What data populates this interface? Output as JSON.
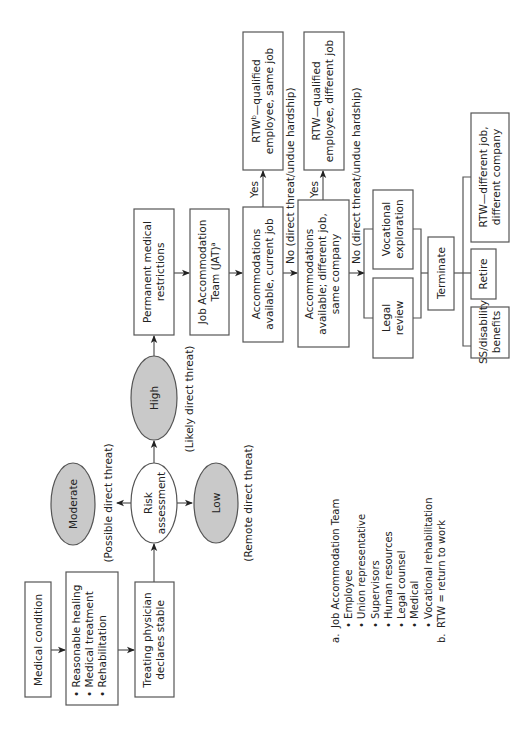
{
  "diagram": {
    "orientation": "rotated-90-ccw",
    "nodes": {
      "medical_condition": "Medical condition",
      "treatment": {
        "items": [
          "Reasonable healing",
          "Medical treatment",
          "Rehabilitation"
        ]
      },
      "treating_physician": [
        "Treating physician",
        "declares stable"
      ],
      "risk_assessment": [
        "Risk",
        "assessment"
      ],
      "moderate": "Moderate",
      "high": "High",
      "low": "Low",
      "permanent_restrictions": [
        "Permanent medical",
        "restrictions"
      ],
      "jat": [
        "Job Accommodation",
        "Team (JAT)",
        "a"
      ],
      "accom_current": [
        "Accommodations",
        "available, current job"
      ],
      "accom_different": [
        "Accommodations",
        "available; different job,",
        "same company"
      ],
      "rtw_same": [
        "RTW",
        "b",
        "—qualified",
        "employee, same job"
      ],
      "rtw_different": [
        "RTW—qualified",
        "employee, different job"
      ],
      "vocational": [
        "Vocational",
        "exploration"
      ],
      "legal": [
        "Legal",
        "review"
      ],
      "terminate": "Terminate",
      "rtw_company": [
        "RTW—different job,",
        "different company"
      ],
      "retire": "Retire",
      "ss_disability": [
        "SS/disability",
        "benefits"
      ]
    },
    "labels": {
      "possible": "(Possible direct threat)",
      "likely": "(Likely direct threat)",
      "remote": "(Remote direct threat)",
      "yes1": "Yes",
      "yes2": "Yes",
      "no1": "No (direct threat/undue hardship)",
      "no2": "No (direct threat/undue hardship)"
    },
    "footnotes": {
      "a_marker": "a.",
      "a_title": "Job Accommodation Team",
      "a_items": [
        "Employee",
        "Union representative",
        "Supervisors",
        "Human resources",
        "Legal counsel",
        "Medical",
        "Vocational rehabilitation"
      ],
      "b_marker": "b.",
      "b_text": "RTW = return to work"
    },
    "colors": {
      "risk_fill": "#c9c9c9",
      "stroke": "#555555"
    }
  }
}
